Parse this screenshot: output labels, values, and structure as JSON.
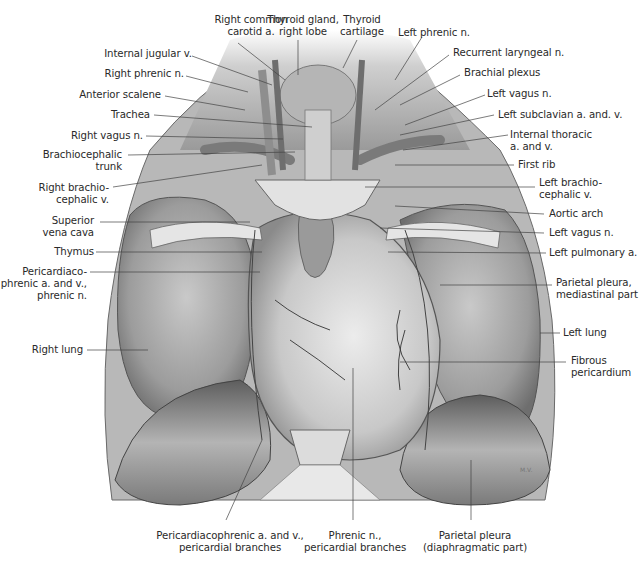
{
  "figure": {
    "signature": "M.V.",
    "colors": {
      "background": "#ffffff",
      "ink": "#2a2a2a",
      "leader": "#444444",
      "tissue_light": "#d9d9d9",
      "tissue_mid": "#a8a8a8",
      "tissue_dark": "#5a5a5a"
    }
  },
  "labels": {
    "top": [
      {
        "id": "right-common-carotid",
        "lines": [
          "Right common",
          "carotid a."
        ]
      },
      {
        "id": "thyroid-gland-right-lobe",
        "lines": [
          "Thyroid gland,",
          "right lobe"
        ]
      },
      {
        "id": "thyroid-cartilage",
        "lines": [
          "Thyroid",
          "cartilage"
        ]
      }
    ],
    "left": [
      {
        "id": "internal-jugular-v",
        "lines": [
          "Internal jugular v."
        ]
      },
      {
        "id": "right-phrenic-n",
        "lines": [
          "Right phrenic n."
        ]
      },
      {
        "id": "anterior-scalene",
        "lines": [
          "Anterior scalene"
        ]
      },
      {
        "id": "trachea",
        "lines": [
          "Trachea"
        ]
      },
      {
        "id": "right-vagus-n",
        "lines": [
          "Right vagus n."
        ]
      },
      {
        "id": "brachiocephalic-trunk",
        "lines": [
          "Brachiocephalic",
          "trunk"
        ]
      },
      {
        "id": "right-brachiocephalic-v",
        "lines": [
          "Right brachio-",
          "cephalic v."
        ]
      },
      {
        "id": "superior-vena-cava",
        "lines": [
          "Superior",
          "vena cava"
        ]
      },
      {
        "id": "thymus",
        "lines": [
          "Thymus"
        ]
      },
      {
        "id": "pericardiacophrenic",
        "lines": [
          "Pericardiaco-",
          "phrenic a. and v.,",
          "phrenic n."
        ]
      },
      {
        "id": "right-lung",
        "lines": [
          "Right lung"
        ]
      }
    ],
    "right": [
      {
        "id": "left-phrenic-n",
        "lines": [
          "Left phrenic n."
        ]
      },
      {
        "id": "recurrent-laryngeal-n",
        "lines": [
          "Recurrent laryngeal n."
        ]
      },
      {
        "id": "brachial-plexus",
        "lines": [
          "Brachial plexus"
        ]
      },
      {
        "id": "left-vagus-n-upper",
        "lines": [
          "Left vagus n."
        ]
      },
      {
        "id": "left-subclavian",
        "lines": [
          "Left subclavian a. and. v."
        ]
      },
      {
        "id": "internal-thoracic",
        "lines": [
          "Internal thoracic",
          "a. and v."
        ]
      },
      {
        "id": "first-rib",
        "lines": [
          "First rib"
        ]
      },
      {
        "id": "left-brachiocephalic-v",
        "lines": [
          "Left brachio-",
          "cephalic v."
        ]
      },
      {
        "id": "aortic-arch",
        "lines": [
          "Aortic arch"
        ]
      },
      {
        "id": "left-vagus-n-lower",
        "lines": [
          "Left vagus n."
        ]
      },
      {
        "id": "left-pulmonary-a",
        "lines": [
          "Left pulmonary a."
        ]
      },
      {
        "id": "parietal-pleura-mediastinal",
        "lines": [
          "Parietal pleura,",
          "mediastinal part"
        ]
      },
      {
        "id": "left-lung",
        "lines": [
          "Left lung"
        ]
      },
      {
        "id": "fibrous-pericardium",
        "lines": [
          "Fibrous",
          "pericardium"
        ]
      }
    ],
    "bottom": [
      {
        "id": "pericardiacophrenic-branches",
        "lines": [
          "Pericardiacophrenic a. and v.,",
          "pericardial branches"
        ]
      },
      {
        "id": "phrenic-n-branches",
        "lines": [
          "Phrenic n.,",
          "pericardial branches"
        ]
      },
      {
        "id": "parietal-pleura-diaphragmatic",
        "lines": [
          "Parietal pleura",
          "(diaphragmatic part)"
        ]
      }
    ]
  }
}
